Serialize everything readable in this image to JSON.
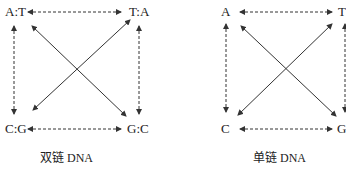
{
  "diagrams": [
    {
      "caption": "双链 DNA",
      "nodes": {
        "top_left": "A:T",
        "top_right": "T:A",
        "bottom_left": "C:G",
        "bottom_right": "G:C"
      }
    },
    {
      "caption": "单链 DNA",
      "nodes": {
        "top_left": "A",
        "top_right": "T",
        "bottom_left": "C",
        "bottom_right": "G"
      }
    }
  ],
  "edges": {
    "horizontal": "dashed bidirectional",
    "vertical": "dashed bidirectional",
    "diagonal": "solid bidirectional"
  }
}
